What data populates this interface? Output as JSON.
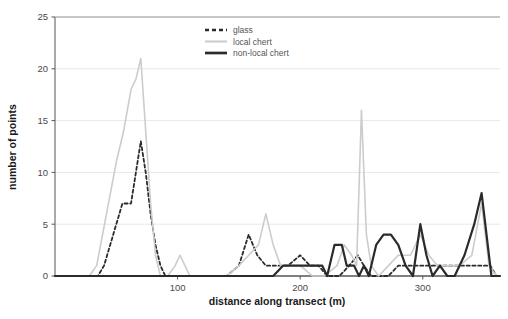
{
  "chart_data": {
    "type": "line",
    "title": "",
    "xlabel": "distance along transect (m)",
    "ylabel": "number of points",
    "xlim": [
      0,
      363
    ],
    "ylim": [
      0,
      25
    ],
    "xticks": [
      100,
      200,
      300
    ],
    "xtick_labels": [
      "100",
      "200",
      "300"
    ],
    "yticks": [
      0,
      5,
      10,
      15,
      20,
      25
    ],
    "ytick_labels": [
      "0",
      "5",
      "10",
      "15",
      "20",
      "25"
    ],
    "grid": true,
    "grid_axis": "y",
    "legend_position": "top-right",
    "series": [
      {
        "name": "glass",
        "style": "dashed",
        "color": "#2b2b2b",
        "width": 1.8,
        "points": [
          [
            0,
            0
          ],
          [
            10,
            0
          ],
          [
            20,
            0
          ],
          [
            30,
            0
          ],
          [
            35,
            0
          ],
          [
            40,
            1
          ],
          [
            45,
            3
          ],
          [
            50,
            5
          ],
          [
            55,
            7
          ],
          [
            58,
            7
          ],
          [
            62,
            7
          ],
          [
            66,
            10
          ],
          [
            70,
            13
          ],
          [
            74,
            10
          ],
          [
            78,
            6
          ],
          [
            82,
            3
          ],
          [
            86,
            1
          ],
          [
            90,
            0
          ],
          [
            100,
            0
          ],
          [
            115,
            0
          ],
          [
            130,
            0
          ],
          [
            140,
            0
          ],
          [
            150,
            1
          ],
          [
            158,
            4
          ],
          [
            165,
            2
          ],
          [
            172,
            1
          ],
          [
            180,
            1
          ],
          [
            190,
            1
          ],
          [
            200,
            2
          ],
          [
            208,
            1
          ],
          [
            215,
            1
          ],
          [
            222,
            0
          ],
          [
            232,
            0
          ],
          [
            240,
            1
          ],
          [
            247,
            2
          ],
          [
            252,
            1
          ],
          [
            258,
            0
          ],
          [
            265,
            0
          ],
          [
            272,
            0
          ],
          [
            280,
            1
          ],
          [
            290,
            1
          ],
          [
            300,
            1
          ],
          [
            310,
            1
          ],
          [
            320,
            1
          ],
          [
            330,
            1
          ],
          [
            340,
            1
          ],
          [
            348,
            1
          ],
          [
            355,
            1
          ],
          [
            360,
            0
          ],
          [
            363,
            0
          ]
        ]
      },
      {
        "name": "local chert",
        "style": "solid",
        "color": "#cccccc",
        "width": 1.6,
        "points": [
          [
            0,
            0
          ],
          [
            10,
            0
          ],
          [
            20,
            0
          ],
          [
            28,
            0
          ],
          [
            34,
            1
          ],
          [
            42,
            6
          ],
          [
            50,
            11
          ],
          [
            56,
            14
          ],
          [
            62,
            18
          ],
          [
            66,
            19
          ],
          [
            70,
            21
          ],
          [
            74,
            14
          ],
          [
            78,
            7
          ],
          [
            82,
            2
          ],
          [
            86,
            0
          ],
          [
            92,
            0
          ],
          [
            98,
            1
          ],
          [
            102,
            2
          ],
          [
            106,
            1
          ],
          [
            110,
            0
          ],
          [
            125,
            0
          ],
          [
            140,
            0
          ],
          [
            150,
            1
          ],
          [
            158,
            2
          ],
          [
            166,
            3
          ],
          [
            172,
            6
          ],
          [
            178,
            3
          ],
          [
            184,
            1
          ],
          [
            190,
            1
          ],
          [
            200,
            1
          ],
          [
            210,
            0
          ],
          [
            220,
            0
          ],
          [
            230,
            1
          ],
          [
            236,
            3
          ],
          [
            242,
            2
          ],
          [
            246,
            1
          ],
          [
            250,
            16
          ],
          [
            254,
            4
          ],
          [
            258,
            1
          ],
          [
            264,
            0
          ],
          [
            272,
            1
          ],
          [
            280,
            2
          ],
          [
            290,
            2
          ],
          [
            298,
            4
          ],
          [
            305,
            2
          ],
          [
            312,
            1
          ],
          [
            320,
            1
          ],
          [
            330,
            1
          ],
          [
            340,
            2
          ],
          [
            348,
            7
          ],
          [
            354,
            1
          ],
          [
            360,
            0
          ],
          [
            363,
            0
          ]
        ]
      },
      {
        "name": "non-local chert",
        "style": "solid",
        "color": "#2b2b2b",
        "width": 2.2,
        "points": [
          [
            0,
            0
          ],
          [
            20,
            0
          ],
          [
            40,
            0
          ],
          [
            60,
            0
          ],
          [
            80,
            0
          ],
          [
            100,
            0
          ],
          [
            120,
            0
          ],
          [
            140,
            0
          ],
          [
            150,
            0
          ],
          [
            160,
            0
          ],
          [
            170,
            0
          ],
          [
            178,
            0
          ],
          [
            186,
            1
          ],
          [
            194,
            1
          ],
          [
            200,
            1
          ],
          [
            210,
            1
          ],
          [
            218,
            1
          ],
          [
            222,
            0
          ],
          [
            228,
            3
          ],
          [
            234,
            3
          ],
          [
            238,
            1
          ],
          [
            244,
            1
          ],
          [
            248,
            0
          ],
          [
            252,
            1
          ],
          [
            256,
            0
          ],
          [
            262,
            3
          ],
          [
            268,
            4
          ],
          [
            274,
            4
          ],
          [
            280,
            3
          ],
          [
            286,
            1
          ],
          [
            292,
            0
          ],
          [
            298,
            5
          ],
          [
            303,
            2
          ],
          [
            308,
            0
          ],
          [
            314,
            1
          ],
          [
            320,
            0
          ],
          [
            326,
            0
          ],
          [
            334,
            2
          ],
          [
            342,
            5
          ],
          [
            348,
            8
          ],
          [
            352,
            4
          ],
          [
            356,
            0
          ],
          [
            363,
            0
          ]
        ]
      }
    ],
    "annotations": {
      "peak_local_chert": 21,
      "peak_glass": 13,
      "peak_non_local_chert": 8,
      "secondary_local_chert_spike": 16
    }
  },
  "legend": {
    "entries": [
      {
        "label": "glass"
      },
      {
        "label": "local chert"
      },
      {
        "label": "non-local chert"
      }
    ]
  },
  "axes": {
    "x_title": "distance along transect (m)",
    "y_title": "number of points"
  }
}
